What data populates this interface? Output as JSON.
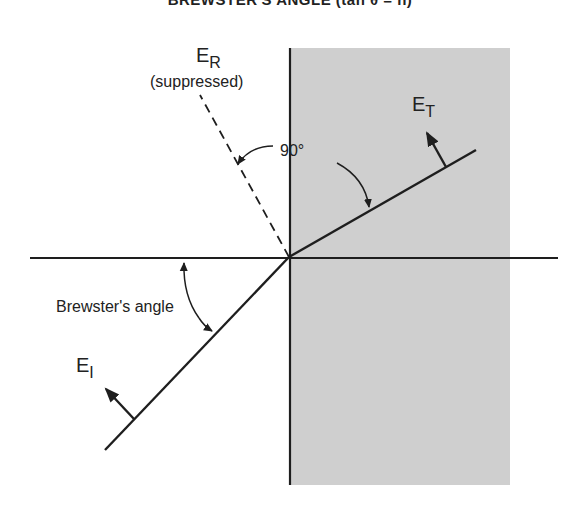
{
  "title": "BREWSTER'S ANGLE (tan θ = n)",
  "labels": {
    "reflected": "E",
    "reflected_sub": "R",
    "reflected_note": "(suppressed)",
    "transmitted": "E",
    "transmitted_sub": "T",
    "incident": "E",
    "incident_sub": "I",
    "right_angle": "90°",
    "brewster": "Brewster's angle"
  },
  "colors": {
    "medium_fill": "#cfcfcf",
    "line": "#1e1e1e"
  }
}
